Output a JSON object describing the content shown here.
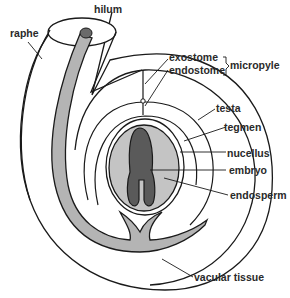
{
  "diagram": {
    "labels": {
      "hilum": "hilum",
      "raphe": "raphe",
      "exostome": "exostome",
      "endostome": "endostome",
      "micropyle": "micropyle",
      "testa": "testa",
      "tegmen": "tegmen",
      "nucellus": "nucellus",
      "embryo": "embryo",
      "endosperm": "endosperm",
      "vascular_tissue": "vacular tissue"
    },
    "colors": {
      "outline": "#1a1a1a",
      "vascular_fill": "#b4b4b4",
      "endosperm_fill": "#c4c4c4",
      "embryo_fill": "#5a5a5a",
      "background": "#ffffff"
    }
  }
}
